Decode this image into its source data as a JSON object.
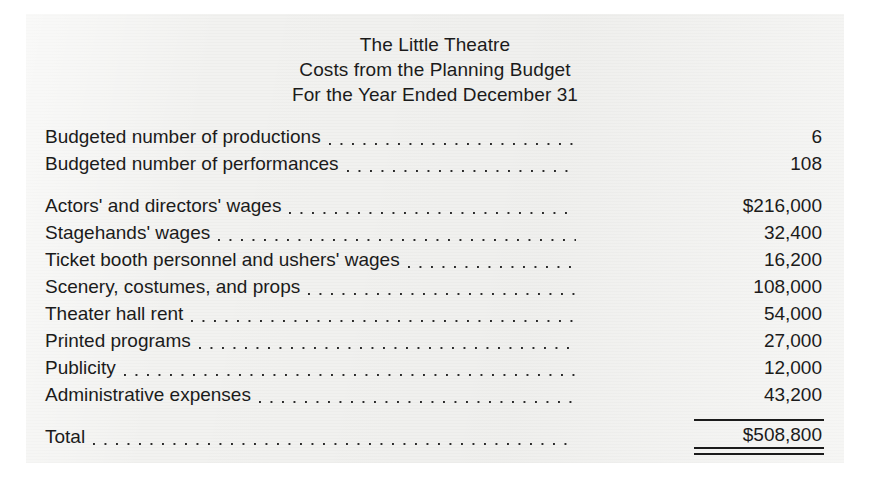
{
  "document": {
    "title_lines": [
      "The Little Theatre",
      "Costs from the Planning Budget",
      "For the Year Ended December 31"
    ],
    "groups": [
      {
        "name": "activity-measures",
        "rows": [
          {
            "label": "Budgeted number of productions",
            "value": "6",
            "rule_above": false,
            "double_rule_below": false
          },
          {
            "label": "Budgeted number of performances",
            "value": "108",
            "rule_above": false,
            "double_rule_below": false
          }
        ]
      },
      {
        "name": "cost-line-items",
        "rows": [
          {
            "label": "Actors' and directors' wages",
            "value": "$216,000",
            "rule_above": false,
            "double_rule_below": false
          },
          {
            "label": "Stagehands' wages",
            "value": "32,400",
            "rule_above": false,
            "double_rule_below": false
          },
          {
            "label": "Ticket booth personnel and ushers' wages",
            "value": "16,200",
            "rule_above": false,
            "double_rule_below": false
          },
          {
            "label": "Scenery, costumes, and props",
            "value": "108,000",
            "rule_above": false,
            "double_rule_below": false
          },
          {
            "label": "Theater hall rent",
            "value": "54,000",
            "rule_above": false,
            "double_rule_below": false
          },
          {
            "label": "Printed programs",
            "value": "27,000",
            "rule_above": false,
            "double_rule_below": false
          },
          {
            "label": "Publicity",
            "value": "12,000",
            "rule_above": false,
            "double_rule_below": false
          },
          {
            "label": "Administrative expenses",
            "value": "43,200",
            "rule_above": false,
            "double_rule_below": false
          }
        ]
      },
      {
        "name": "total",
        "rows": [
          {
            "label": "Total",
            "value": "$508,800",
            "rule_above": true,
            "double_rule_below": true
          }
        ]
      }
    ],
    "colors": {
      "paper": "#f2f2f0",
      "ink": "#1b1b1b",
      "page_background": "#ffffff"
    }
  }
}
